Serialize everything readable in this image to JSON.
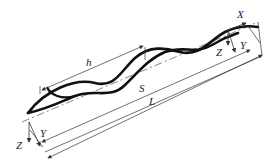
{
  "diagram": {
    "type": "twisted-helix-geometry",
    "colors": {
      "strand": "#111111",
      "line": "#333333",
      "background": "#ffffff"
    },
    "labels": {
      "pitch": "h",
      "span_s": "S",
      "span_l": "L",
      "end_x": "X",
      "end_y": "Y",
      "end_z": "Z",
      "start_y": "Y",
      "start_z": "Z"
    },
    "dimensions": [
      {
        "name": "h",
        "meaning": "pitch length"
      },
      {
        "name": "S",
        "meaning": "axial span"
      },
      {
        "name": "L",
        "meaning": "total length"
      }
    ],
    "axes": {
      "start": [
        "Y",
        "Z"
      ],
      "end": [
        "X",
        "Y",
        "Z"
      ]
    }
  }
}
